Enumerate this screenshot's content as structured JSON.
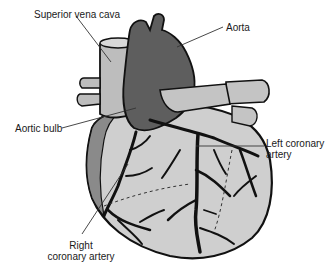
{
  "diagram": {
    "colors": {
      "background": "#ffffff",
      "aorta": "#5e5e5e",
      "vessels_light": "#c4c4c4",
      "heart_surface": "#cfcfcf",
      "outline": "#111111",
      "leader_line": "#333333",
      "text": "#1a1a1a"
    },
    "labels": [
      {
        "id": "superior-vena-cava",
        "text": "Superior vena cava",
        "line2": ""
      },
      {
        "id": "aorta",
        "text": "Aorta",
        "line2": ""
      },
      {
        "id": "aortic-bulb",
        "text": "Aortic bulb",
        "line2": ""
      },
      {
        "id": "left-coronary-artery",
        "text": "Left coronary",
        "line2": "artery"
      },
      {
        "id": "right-coronary-artery",
        "text": "Right",
        "line2": "coronary artery"
      }
    ]
  }
}
